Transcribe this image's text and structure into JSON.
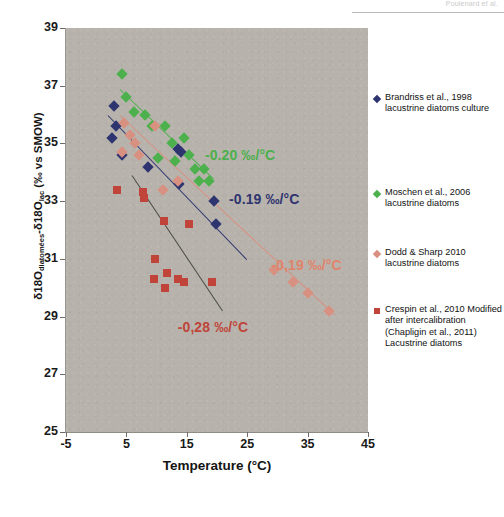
{
  "page_header": {
    "text": "Poulenard et al.",
    "visible": true
  },
  "chart_data": {
    "type": "scatter",
    "title": "",
    "xlabel": "Temperature (°C)",
    "ylabel_parts": {
      "pre": "δ18O",
      "sub1": "diatomées",
      "mid": "-δ18O",
      "sub2": "lac",
      "post": " (‰ vs SMOW)"
    },
    "ylabel": "δ18Odiatomées-δ18Olac (‰ vs SMOW)",
    "xlim": [
      -5,
      45
    ],
    "ylim": [
      25,
      39
    ],
    "xticks": [
      -5,
      5,
      15,
      25,
      35,
      45
    ],
    "yticks": [
      25,
      27,
      29,
      31,
      33,
      35,
      37,
      39
    ],
    "grid": false,
    "legend_position": "right",
    "plot_background": "#b7b3ac",
    "series": [
      {
        "name": "Brandriss et al., 1998 lacustrine diatoms culture",
        "legend_label": "Brandriss et al., 1998 lacustrine diatoms culture",
        "color": "#2e3470",
        "marker": "diamond",
        "slope_label": "-0.19 ‰/°C",
        "slope": -0.19,
        "points": [
          {
            "x": 3.0,
            "y": 36.3
          },
          {
            "x": 2.6,
            "y": 35.2
          },
          {
            "x": 3.2,
            "y": 35.6
          },
          {
            "x": 4.2,
            "y": 34.6
          },
          {
            "x": 8.5,
            "y": 34.2
          },
          {
            "x": 13.5,
            "y": 34.8
          },
          {
            "x": 14.0,
            "y": 34.7
          },
          {
            "x": 13.7,
            "y": 33.6
          },
          {
            "x": 19.5,
            "y": 33.0
          },
          {
            "x": 19.8,
            "y": 32.2
          }
        ],
        "regression": {
          "x1": 2.0,
          "y1": 36.0,
          "x2": 25.0,
          "y2": 31.0
        }
      },
      {
        "name": "Moschen et al., 2006 lacustrine diatoms",
        "legend_label": "Moschen et al., 2006 lacustrine diatoms",
        "color": "#4cb04c",
        "marker": "diamond",
        "slope_label": "-0.20 ‰/°C",
        "slope": -0.2,
        "points": [
          {
            "x": 4.3,
            "y": 37.4
          },
          {
            "x": 5.0,
            "y": 36.6
          },
          {
            "x": 6.2,
            "y": 36.1
          },
          {
            "x": 8.1,
            "y": 36.0
          },
          {
            "x": 9.2,
            "y": 35.6
          },
          {
            "x": 11.4,
            "y": 35.6
          },
          {
            "x": 10.2,
            "y": 34.5
          },
          {
            "x": 12.5,
            "y": 35.0
          },
          {
            "x": 13.0,
            "y": 34.4
          },
          {
            "x": 14.6,
            "y": 35.2
          },
          {
            "x": 15.3,
            "y": 34.6
          },
          {
            "x": 16.4,
            "y": 34.1
          },
          {
            "x": 17.8,
            "y": 34.1
          },
          {
            "x": 17.0,
            "y": 33.7
          },
          {
            "x": 18.6,
            "y": 33.7
          }
        ],
        "regression": {
          "x1": 4.0,
          "y1": 36.9,
          "x2": 19.5,
          "y2": 33.8
        }
      },
      {
        "name": "Dodd & Sharp 2010 lacustrine diatoms",
        "legend_label": "Dodd & Sharp 2010 lacustrine diatoms",
        "color": "#d89080",
        "marker": "diamond",
        "slope_label": "-0,19 ‰/°C",
        "slope": -0.19,
        "points": [
          {
            "x": 4.6,
            "y": 35.7
          },
          {
            "x": 4.2,
            "y": 34.7
          },
          {
            "x": 5.6,
            "y": 35.3
          },
          {
            "x": 6.4,
            "y": 35.0
          },
          {
            "x": 7.1,
            "y": 34.6
          },
          {
            "x": 9.8,
            "y": 35.6
          },
          {
            "x": 11.0,
            "y": 33.4
          },
          {
            "x": 13.5,
            "y": 33.7
          },
          {
            "x": 29.5,
            "y": 30.6
          },
          {
            "x": 32.5,
            "y": 30.2
          },
          {
            "x": 35.0,
            "y": 29.8
          },
          {
            "x": 38.5,
            "y": 29.2
          }
        ],
        "regression": {
          "x1": 4.0,
          "y1": 36.0,
          "x2": 39.5,
          "y2": 29.1
        }
      },
      {
        "name": "Crespin et al., 2010 Modified after intercalibration (Chapligin et al., 2011) Lacustrine diatoms",
        "legend_label": "Crespin et al., 2010 Modified after intercalibration (Chapligin et al., 2011) Lacustrine diatoms",
        "color": "#c0443a",
        "marker": "square",
        "slope_label": "-0,28 ‰/°C",
        "slope": -0.28,
        "points": [
          {
            "x": 3.4,
            "y": 33.4
          },
          {
            "x": 7.7,
            "y": 33.3
          },
          {
            "x": 7.9,
            "y": 33.1
          },
          {
            "x": 11.2,
            "y": 32.3
          },
          {
            "x": 9.8,
            "y": 31.0
          },
          {
            "x": 11.8,
            "y": 30.5
          },
          {
            "x": 9.6,
            "y": 30.3
          },
          {
            "x": 11.4,
            "y": 30.0
          },
          {
            "x": 13.6,
            "y": 30.3
          },
          {
            "x": 14.6,
            "y": 30.2
          },
          {
            "x": 19.2,
            "y": 30.2
          },
          {
            "x": 15.4,
            "y": 32.2
          }
        ],
        "regression": {
          "x1": 6.0,
          "y1": 33.9,
          "x2": 21.0,
          "y2": 29.2
        }
      }
    ],
    "annotations": [
      {
        "text": "-0.20 ‰/°C",
        "color": "#4cb04c",
        "x": 18.0,
        "y": 34.55
      },
      {
        "text": "-0.19 ‰/°C",
        "color": "#2e3470",
        "x": 22.0,
        "y": 33.05
      },
      {
        "text": "-0,19 ‰/°C",
        "color": "#e0836b",
        "x": 29.0,
        "y": 30.75
      },
      {
        "text": "-0,28 ‰/°C",
        "color": "#c0443a",
        "x": 13.5,
        "y": 28.6
      }
    ]
  }
}
